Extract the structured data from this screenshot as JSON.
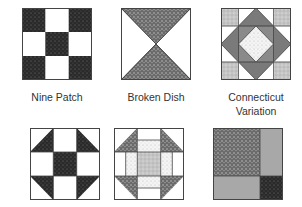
{
  "colors": {
    "dark": "#2a2a2a",
    "medium": "#6e6e6e",
    "gray": "#8c8c8c",
    "light": "#c8c8c8",
    "outline": "#555555",
    "white": "#ffffff"
  },
  "blocks": [
    {
      "id": "nine-patch",
      "label": "Nine Patch"
    },
    {
      "id": "broken-dish",
      "label": "Broken Dish"
    },
    {
      "id": "connecticut-variation",
      "label_line1": "Connecticut",
      "label_line2": "Variation"
    },
    {
      "id": "shoofly",
      "label": ""
    },
    {
      "id": "churn-dash-variation",
      "label": ""
    },
    {
      "id": "four-rectangle",
      "label": ""
    }
  ]
}
